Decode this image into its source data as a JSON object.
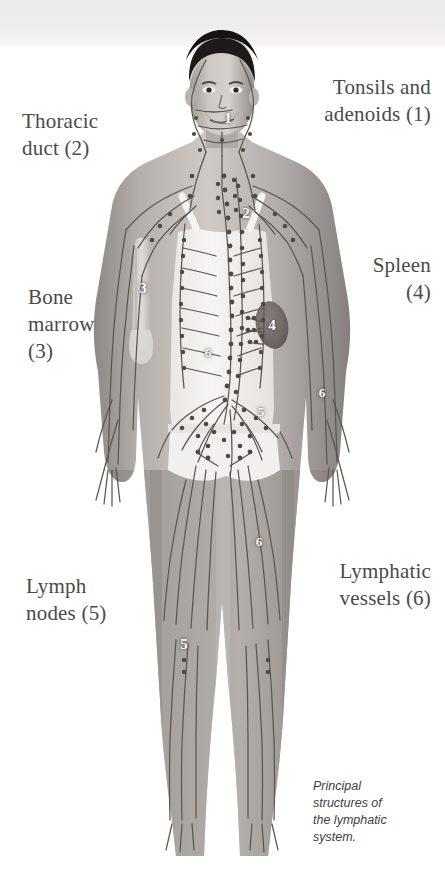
{
  "figure": {
    "title": "Principal structures of the lymphatic system",
    "caption": "Principal\nstructures of\nthe lymphatic\nsystem.",
    "background_color": "#ffffff",
    "band_color": "#eceaea"
  },
  "labels": {
    "tonsils": "Tonsils and\nadenoids (1)",
    "thoracic_duct": "Thoracic\nduct (2)",
    "spleen": "Spleen\n(4)",
    "bone_marrow": "Bone\nmarrow\n(3)",
    "lymph_nodes": "Lymph\nnodes (5)",
    "lymphatic_vessels": "Lymphatic\nvessels (6)"
  },
  "legend": [
    {
      "number": "1",
      "name": "Tonsils and adenoids"
    },
    {
      "number": "2",
      "name": "Thoracic duct"
    },
    {
      "number": "3",
      "name": "Bone marrow"
    },
    {
      "number": "4",
      "name": "Spleen"
    },
    {
      "number": "5",
      "name": "Lymph nodes"
    },
    {
      "number": "6",
      "name": "Lymphatic vessels"
    }
  ],
  "markers": [
    {
      "id": "marker-1-tonsils",
      "number": "1",
      "x": 228,
      "y": 118
    },
    {
      "id": "marker-2-duct",
      "number": "2",
      "x": 246,
      "y": 213
    },
    {
      "id": "marker-3-marrow",
      "number": "3",
      "x": 143,
      "y": 288
    },
    {
      "id": "marker-4-spleen",
      "number": "4",
      "x": 272,
      "y": 325
    },
    {
      "id": "marker-6-abdomen",
      "number": "6",
      "x": 208,
      "y": 352
    },
    {
      "id": "marker-6-arm",
      "number": "6",
      "x": 322,
      "y": 392
    },
    {
      "id": "marker-5-groin",
      "number": "5",
      "x": 261,
      "y": 411
    },
    {
      "id": "marker-6-thigh",
      "number": "6",
      "x": 259,
      "y": 541
    },
    {
      "id": "marker-5-knee",
      "number": "5",
      "x": 184,
      "y": 643
    }
  ],
  "colors": {
    "label_text": "#4a4a4a",
    "caption_text": "#3d3d3d",
    "marker_text": "#ffffff",
    "skin_light": "#d8d4d1",
    "skin_mid": "#a8a39f",
    "skin_dark": "#6f6a67",
    "vessel": "#555049",
    "spleen": "#6e6662",
    "garment": "#f4f2f0"
  }
}
